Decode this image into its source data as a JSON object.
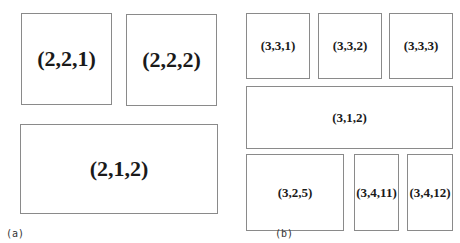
{
  "panels": {
    "a": {
      "caption": "(a)",
      "boxes": [
        {
          "label": "(2,2,1)"
        },
        {
          "label": "(2,2,2)"
        },
        {
          "label": "(2,1,2)"
        }
      ]
    },
    "b": {
      "caption": "(b)",
      "boxes": [
        {
          "label": "(3,3,1)"
        },
        {
          "label": "(3,3,2)"
        },
        {
          "label": "(3,3,3)"
        },
        {
          "label": "(3,1,2)"
        },
        {
          "label": "(3,2,5)"
        },
        {
          "label": "(3,4,11)"
        },
        {
          "label": "(3,4,12)"
        }
      ]
    }
  }
}
